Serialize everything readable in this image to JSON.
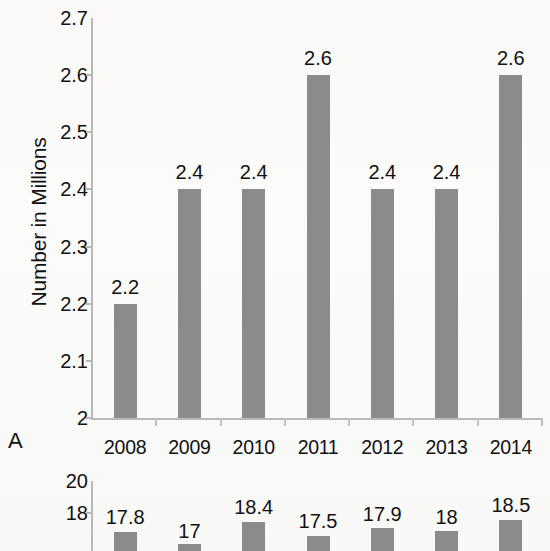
{
  "figure": {
    "panel_a_letter": "A",
    "bar_color": "#8b8b8b",
    "axis_color": "#b9b9b9",
    "text_color": "#111111",
    "background": "#fbfbfa"
  },
  "chart_data": [
    {
      "type": "bar",
      "panel": "A",
      "title": "",
      "xlabel": "",
      "ylabel": "Number in Millions",
      "categories": [
        "2008",
        "2009",
        "2010",
        "2011",
        "2012",
        "2013",
        "2014"
      ],
      "values": [
        2.2,
        2.4,
        2.4,
        2.6,
        2.4,
        2.4,
        2.6
      ],
      "data_labels": [
        "2.2",
        "2.4",
        "2.4",
        "2.6",
        "2.4",
        "2.4",
        "2.6"
      ],
      "ylim": [
        2,
        2.7
      ],
      "yticks": [
        2,
        2.1,
        2.2,
        2.3,
        2.4,
        2.5,
        2.6,
        2.7
      ],
      "ytick_labels": [
        "2",
        "2.1",
        "2.2",
        "2.3",
        "2.4",
        "2.5",
        "2.6",
        "2.7"
      ],
      "grid": false,
      "legend": "none"
    },
    {
      "type": "bar",
      "panel": "B",
      "title": "",
      "xlabel": "",
      "ylabel": "",
      "note": "partially visible / cropped at bottom of image",
      "categories": [
        "2008",
        "2009",
        "2010",
        "2011",
        "2012",
        "2013",
        "2014"
      ],
      "values": [
        17.8,
        17,
        18.4,
        17.5,
        17.9,
        18,
        18.5
      ],
      "data_labels": [
        "17.8",
        "17",
        "18.4",
        "17.5",
        "17.9",
        "18",
        "18.5"
      ],
      "ylim": [
        null,
        20
      ],
      "yticks": [
        20,
        18
      ],
      "ytick_labels": [
        "20",
        "18"
      ],
      "grid": false,
      "legend": "none"
    }
  ]
}
